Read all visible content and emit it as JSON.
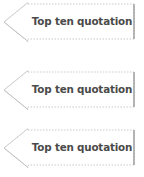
{
  "canvas": {
    "width": 144,
    "height": 177,
    "background_color": "#ffffff"
  },
  "style": {
    "shape_fill": "#ffffff",
    "border_color_dotted": "#c9c9c9",
    "border_color_solid": "#9a9a9a",
    "text_color": "#4a4a4a"
  },
  "banners": [
    {
      "label": "Top ten quotation",
      "shape": "left-pointing-arrow-banner",
      "index": 1
    },
    {
      "label": "Top ten quotation",
      "shape": "left-pointing-arrow-banner",
      "index": 2
    },
    {
      "label": "Top ten quotation",
      "shape": "left-pointing-arrow-banner",
      "index": 3
    }
  ]
}
